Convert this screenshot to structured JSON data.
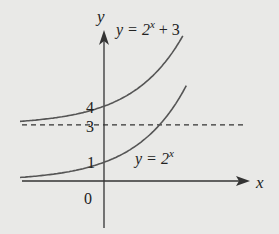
{
  "chart_data": {
    "type": "line",
    "title": "",
    "xlabel": "x",
    "ylabel": "y",
    "series": [
      {
        "name": "y = 2^x",
        "label_base": "y = 2",
        "label_exp": "x",
        "label_suffix": "",
        "formula": "2^x",
        "y_intercept": 1
      },
      {
        "name": "y = 2^x + 3",
        "label_base": "y = 2",
        "label_exp": "x",
        "label_suffix": " + 3",
        "formula": "2^x + 3",
        "y_intercept": 4
      }
    ],
    "asymptote": {
      "y": 3,
      "style": "dashed"
    },
    "tick_labels": {
      "origin": "0",
      "y1": "1",
      "y3": "3",
      "y4": "4"
    },
    "xlim": [
      -2.6,
      4.2
    ],
    "ylim": [
      -2.8,
      4.8
    ],
    "grid": false,
    "legend": "none"
  }
}
